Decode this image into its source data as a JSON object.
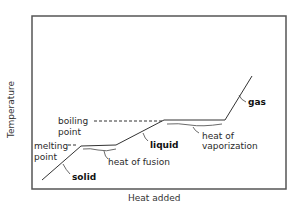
{
  "diagram": {
    "type": "heating curve",
    "axes": {
      "xlabel": "Heat added",
      "ylabel": "Temperature"
    },
    "labels": {
      "boiling_point_1": "boiling",
      "boiling_point_2": "point",
      "melting_point_1": "melting",
      "melting_point_2": "point",
      "solid": "solid",
      "liquid": "liquid",
      "gas": "gas",
      "heat_of_fusion": "heat of fusion",
      "heat_of_vaporization_1": "heat of",
      "heat_of_vaporization_2": "vaporization"
    },
    "curve_points": [
      [
        42,
        180
      ],
      [
        81,
        146
      ],
      [
        116,
        145
      ],
      [
        164,
        120
      ],
      [
        225,
        120
      ],
      [
        252,
        76
      ]
    ],
    "colors": {
      "line": "#333333",
      "frame": "#555555",
      "background": "#ffffff"
    }
  }
}
